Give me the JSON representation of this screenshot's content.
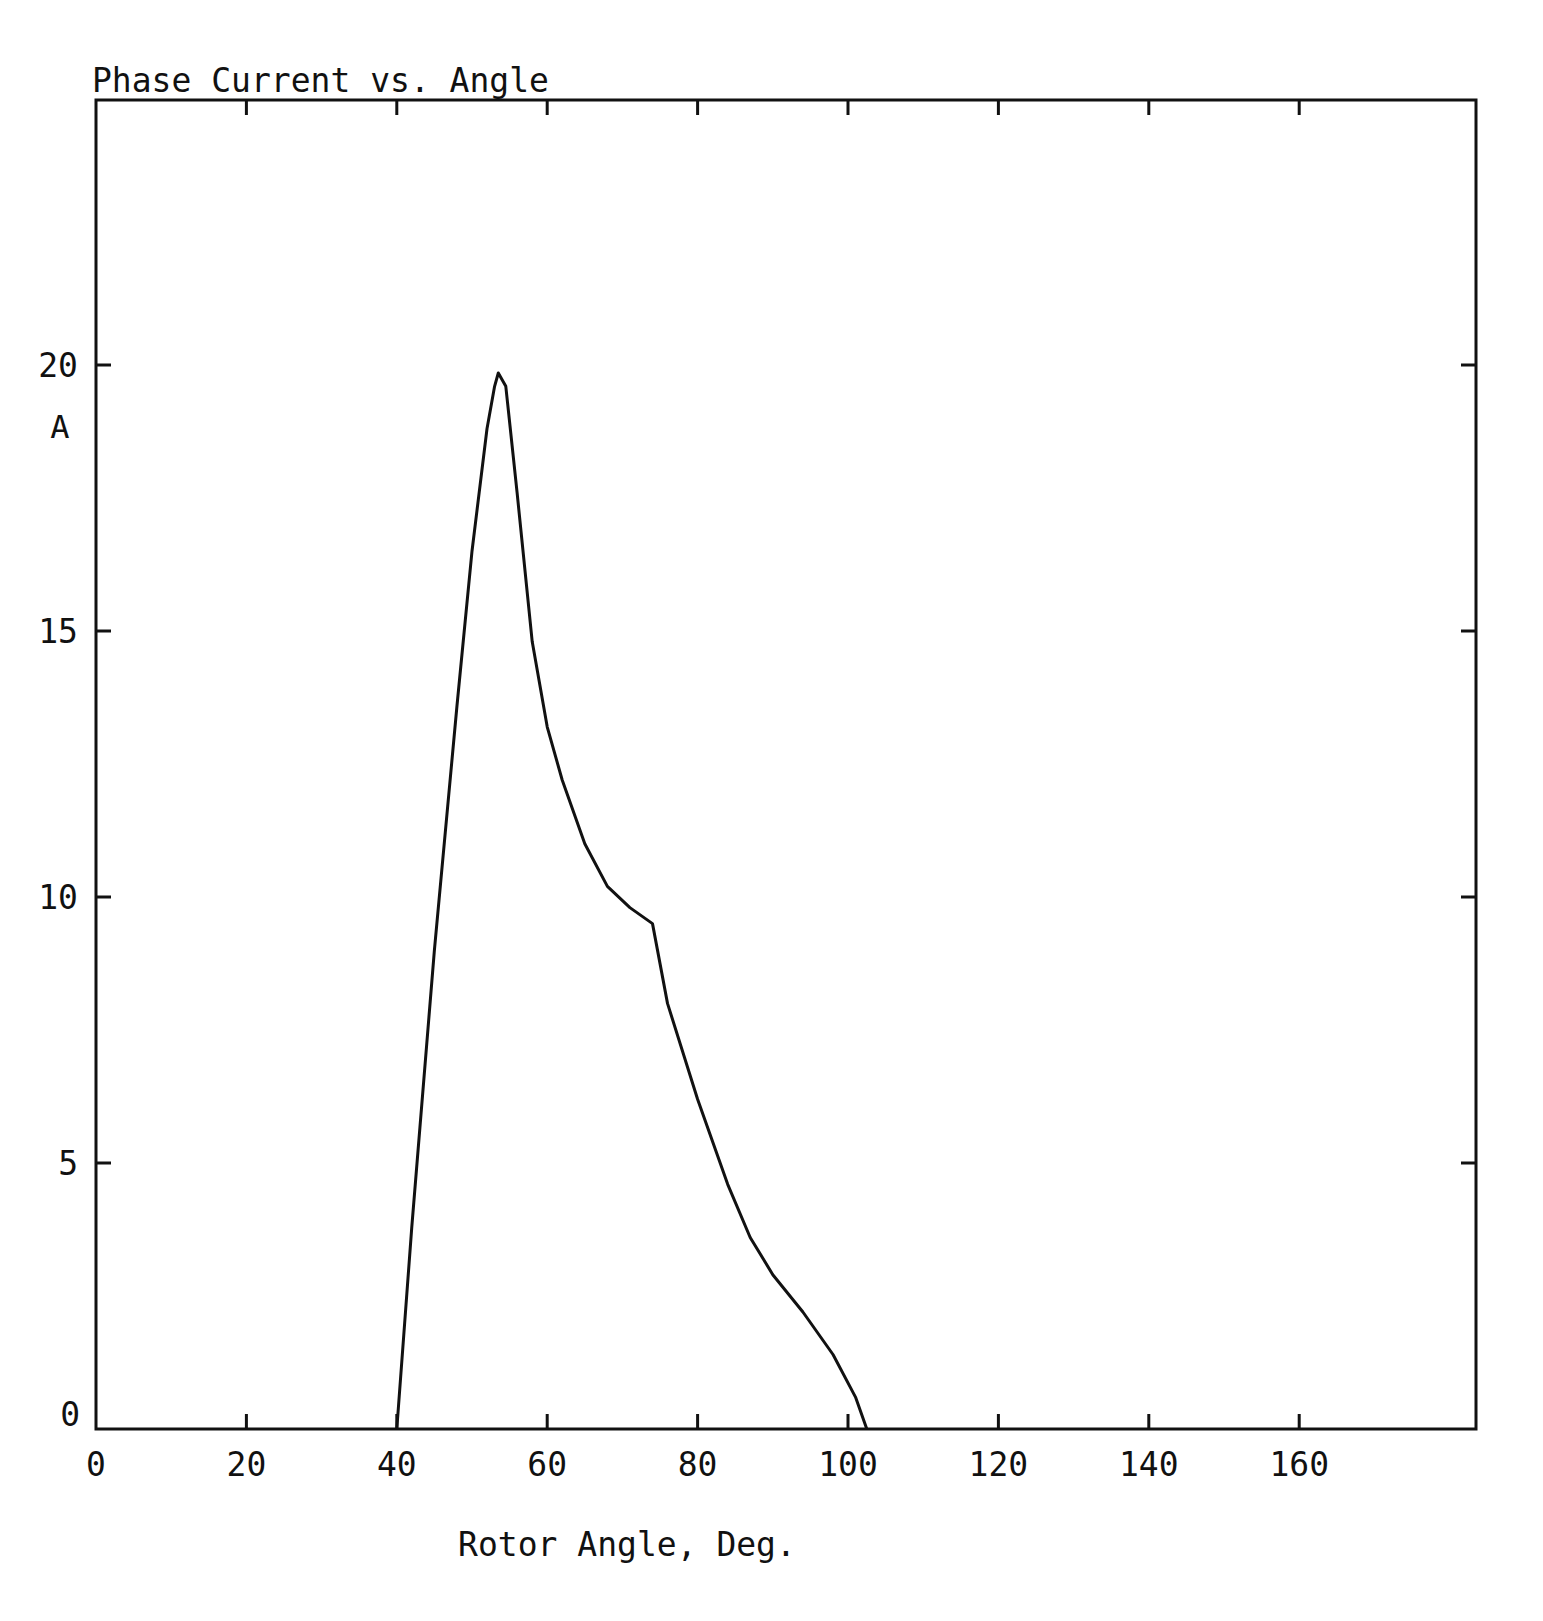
{
  "chart_data": {
    "type": "line",
    "title": "Phase Current vs. Angle",
    "xlabel": "Rotor Angle, Deg.",
    "ylabel": "A",
    "xlim": [
      0,
      178
    ],
    "ylim": [
      0,
      24.9
    ],
    "x_ticks": [
      0,
      20,
      40,
      60,
      80,
      100,
      120,
      140,
      160
    ],
    "x_tick_labels": [
      "0",
      "20",
      "40",
      "60",
      "80",
      "100",
      "120",
      "140",
      "160"
    ],
    "y_ticks": [
      0,
      5,
      10,
      15,
      20
    ],
    "y_tick_labels": [
      "0",
      "5",
      "10",
      "15",
      "20"
    ],
    "grid": false,
    "legend": null,
    "series": [
      {
        "name": "Phase Current",
        "x": [
          40,
          42,
          45,
          48,
          50,
          52,
          53,
          53.5,
          54.5,
          56,
          58,
          60,
          62,
          65,
          68,
          71,
          74,
          76,
          80,
          84,
          87,
          90,
          94,
          98,
          101,
          102.5
        ],
        "y": [
          0,
          3.8,
          9.0,
          13.6,
          16.5,
          18.8,
          19.6,
          19.85,
          19.6,
          17.6,
          14.8,
          13.2,
          12.2,
          11.0,
          10.2,
          9.8,
          9.5,
          8.0,
          6.2,
          4.6,
          3.6,
          2.9,
          2.2,
          1.4,
          0.6,
          0
        ]
      }
    ],
    "colors": {
      "line": "#111111",
      "axes": "#111111",
      "background": "#ffffff"
    }
  }
}
